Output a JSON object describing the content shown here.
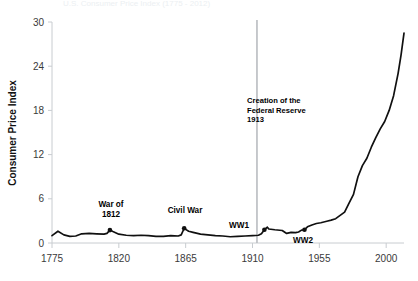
{
  "chart_data": {
    "type": "line",
    "title": "U.S. Consumer Price Index (1775 - 2012)",
    "xlabel": "",
    "ylabel": "Consumer Price Index",
    "xlim": [
      1775,
      2012
    ],
    "ylim": [
      0,
      30
    ],
    "grid": false,
    "legend_position": "none",
    "xticks": [
      1775,
      1820,
      1865,
      1910,
      1955,
      2000
    ],
    "yticks": [
      0,
      6,
      12,
      18,
      24,
      30
    ],
    "series": [
      {
        "name": "Consumer Price Index",
        "color": "#101010",
        "x": [
          1775,
          1779,
          1783,
          1787,
          1791,
          1795,
          1800,
          1805,
          1810,
          1812,
          1814,
          1816,
          1820,
          1825,
          1830,
          1835,
          1840,
          1845,
          1850,
          1855,
          1860,
          1862,
          1864,
          1865,
          1867,
          1870,
          1875,
          1880,
          1885,
          1890,
          1895,
          1900,
          1905,
          1910,
          1914,
          1916,
          1918,
          1920,
          1921,
          1925,
          1930,
          1933,
          1936,
          1939,
          1941,
          1943,
          1945,
          1947,
          1950,
          1953,
          1956,
          1960,
          1963,
          1966,
          1969,
          1972,
          1975,
          1978,
          1981,
          1984,
          1987,
          1990,
          1993,
          1996,
          1999,
          2002,
          2005,
          2008,
          2010,
          2012
        ],
        "y": [
          1.0,
          1.6,
          1.1,
          0.9,
          0.95,
          1.25,
          1.3,
          1.25,
          1.2,
          1.3,
          1.75,
          1.55,
          1.2,
          1.05,
          1.0,
          1.05,
          1.0,
          0.9,
          0.9,
          1.0,
          0.95,
          1.1,
          2.0,
          1.85,
          1.6,
          1.45,
          1.2,
          1.1,
          1.0,
          0.95,
          0.85,
          0.9,
          0.95,
          1.0,
          1.05,
          1.25,
          1.8,
          2.15,
          1.9,
          1.8,
          1.7,
          1.3,
          1.45,
          1.4,
          1.5,
          1.75,
          1.8,
          2.2,
          2.45,
          2.65,
          2.75,
          2.95,
          3.1,
          3.3,
          3.75,
          4.2,
          5.4,
          6.6,
          9.0,
          10.5,
          11.5,
          13.0,
          14.3,
          15.5,
          16.5,
          18.0,
          20.0,
          23.0,
          25.5,
          28.5
        ]
      }
    ],
    "annotations": [
      {
        "id": "war-of-1812",
        "lines": [
          "War of",
          "1812"
        ],
        "label_x": 111,
        "label_y": 207,
        "dot_year": 1814,
        "dot_value": 1.75
      },
      {
        "id": "civil-war",
        "lines": [
          "Civil War"
        ],
        "label_x": 185,
        "label_y": 213,
        "dot_year": 1864,
        "dot_value": 2.0
      },
      {
        "id": "ww1",
        "lines": [
          "WW1"
        ],
        "label_x": 239,
        "label_y": 228,
        "dot_year": 1918,
        "dot_value": 1.8
      },
      {
        "id": "ww2",
        "lines": [
          "WW2"
        ],
        "label_x": 303,
        "label_y": 243,
        "dot_year": 1945,
        "dot_value": 1.8
      }
    ],
    "vertical_marker": {
      "id": "federal-reserve",
      "year": 1913,
      "color": "#b9bcc0",
      "lines": [
        "Creation of the",
        "Federal Reserve",
        "1913"
      ],
      "label_x": 247,
      "label_y": 103
    }
  }
}
